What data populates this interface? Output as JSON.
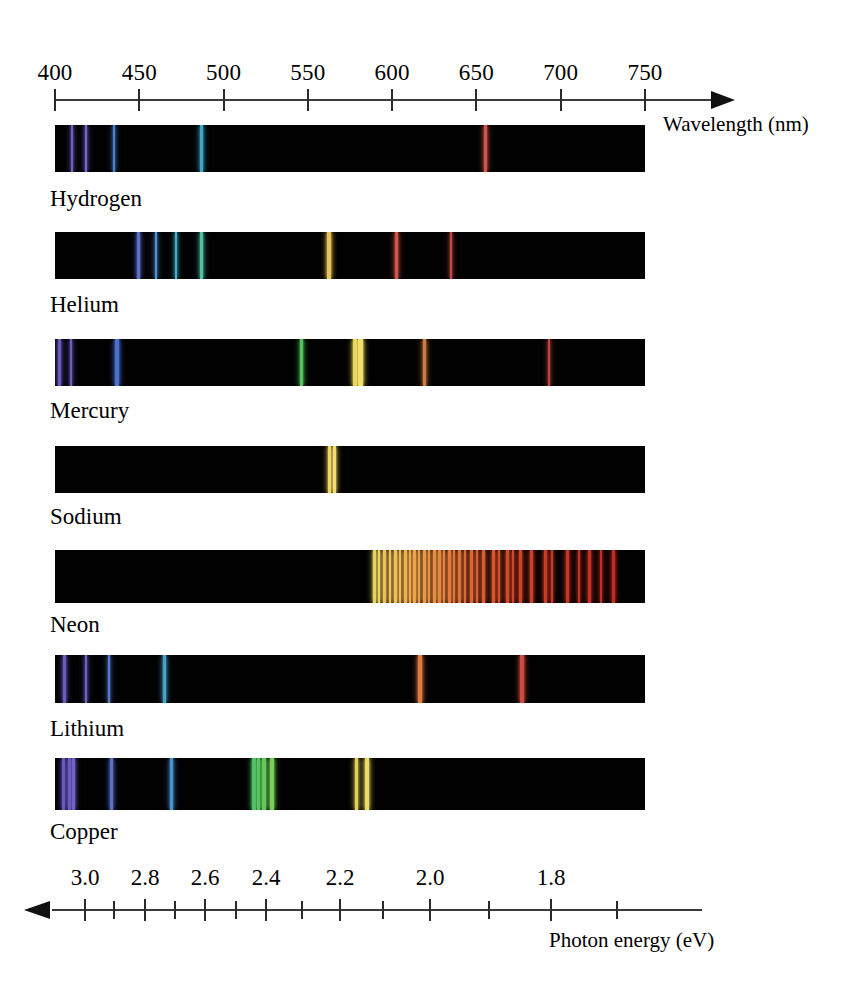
{
  "figure": {
    "kind": "emission-line-spectra",
    "background_color": "#ffffff",
    "band_color": "#010101"
  },
  "wavelength_axis": {
    "title": "Wavelength (nm)",
    "unit": "nm",
    "direction": "left-to-right",
    "arrow": "right",
    "range_nm": [
      390,
      760
    ],
    "pixel_range": [
      55,
      645
    ],
    "ticks": [
      400,
      450,
      500,
      550,
      600,
      650,
      700,
      750
    ],
    "tick_labels": [
      "400",
      "450",
      "500",
      "550",
      "600",
      "650",
      "700",
      "750"
    ]
  },
  "energy_axis": {
    "title": "Photon energy (eV)",
    "unit": "eV",
    "direction": "right-to-left",
    "arrow": "left",
    "major_ticks": [
      3.0,
      2.8,
      2.6,
      2.4,
      2.2,
      2.0,
      1.8
    ],
    "major_tick_labels": [
      "3.0",
      "2.8",
      "2.6",
      "2.4",
      "2.2",
      "2.0",
      "1.8"
    ],
    "minor_ticks": [
      2.9,
      2.7,
      2.5,
      2.3,
      2.1,
      1.9,
      1.7
    ],
    "major_pixels": [
      85,
      145,
      205,
      266,
      340,
      430,
      551
    ],
    "minor_pixels": [
      114,
      175,
      236,
      302,
      383,
      489,
      617
    ],
    "line_pixel_range": [
      52,
      702
    ]
  },
  "chart_data": {
    "type": "line-spectrum",
    "title": "",
    "xlabel": "Wavelength (nm)",
    "secondary_xlabel": "Photon energy (eV)",
    "xlim": [
      390,
      760
    ],
    "grid": false,
    "legend": "none",
    "series": [
      {
        "name": "Hydrogen",
        "lines_nm": [
          410,
          434,
          486,
          656
        ],
        "line_pixels": [
          71,
          85,
          113,
          200,
          484
        ],
        "line_widths": [
          2,
          2,
          2,
          3,
          3
        ],
        "line_colors": [
          "#6d5fbd",
          "#7766c8",
          "#4a7fd0",
          "#3fa7c7",
          "#d0554b"
        ]
      },
      {
        "name": "Helium",
        "lines_nm": [
          447,
          471,
          492,
          502,
          588,
          668,
          706
        ],
        "line_pixels": [
          137,
          155,
          175,
          200,
          327,
          395,
          450
        ],
        "line_widths": [
          3,
          2,
          2,
          3,
          4,
          3,
          2
        ],
        "line_colors": [
          "#5e6fcc",
          "#4f8fd2",
          "#3fb0c6",
          "#52bfa0",
          "#e8c25c",
          "#d0554b",
          "#c14a42"
        ]
      },
      {
        "name": "Mercury",
        "lines_nm": [
          405,
          408,
          436,
          546,
          577,
          579,
          615,
          691
        ],
        "line_pixels": [
          58,
          70,
          115,
          300,
          353,
          358,
          423,
          548
        ],
        "line_widths": [
          3,
          2,
          4,
          3,
          4,
          5,
          3,
          2
        ],
        "line_colors": [
          "#6b58c0",
          "#6d5fbd",
          "#4b6fd0",
          "#55c35f",
          "#e6d558",
          "#f2e06a",
          "#cf7a45",
          "#bb463f"
        ]
      },
      {
        "name": "Sodium",
        "lines_nm": [
          589.0,
          589.6
        ],
        "line_pixels": [
          328,
          333
        ],
        "line_widths": [
          3,
          3
        ],
        "line_colors": [
          "#f0d563",
          "#f3dc70"
        ]
      },
      {
        "name": "Neon",
        "lines_nm": [
          585,
          588,
          594,
          597,
          603,
          607,
          609,
          614,
          616,
          621,
          626,
          630,
          633,
          638,
          640,
          650,
          653,
          660,
          667,
          671,
          692,
          703,
          717,
          724,
          743
        ],
        "line_pixels": [
          373,
          378,
          383,
          389,
          394,
          399,
          404,
          409,
          413,
          418,
          423,
          428,
          433,
          438,
          443,
          448,
          453,
          458,
          464,
          470,
          476,
          482,
          492,
          498,
          506,
          512,
          519,
          530,
          544,
          551,
          566,
          578,
          588,
          600,
          612
        ],
        "line_widths": [
          3,
          2,
          3,
          2,
          3,
          2,
          3,
          2,
          3,
          2,
          3,
          2,
          3,
          3,
          2,
          3,
          2,
          3,
          2,
          3,
          2,
          3,
          3,
          2,
          3,
          2,
          3,
          3,
          3,
          2,
          3,
          2,
          3,
          2,
          3
        ],
        "line_colors": [
          "#e8d25e",
          "#ecd864",
          "#eebf58",
          "#efc35c",
          "#f0c05a",
          "#edb955",
          "#eeb452",
          "#eda94e",
          "#eba54c",
          "#eb9e49",
          "#e99a47",
          "#e89445",
          "#e78e43",
          "#e68841",
          "#e5833f",
          "#e37c3d",
          "#e2763b",
          "#e17139",
          "#df6b37",
          "#de6535",
          "#dc6033",
          "#da5a31",
          "#d8552f",
          "#d6502d",
          "#d44b2c",
          "#d2472b",
          "#d0432a",
          "#ce3f29",
          "#cc3b28",
          "#ca3827",
          "#c83526",
          "#c63225",
          "#c43024",
          "#c22e23",
          "#c02c22"
        ]
      },
      {
        "name": "Lithium",
        "lines_nm": [
          413,
          427,
          441,
          460,
          610,
          671
        ],
        "line_pixels": [
          63,
          85,
          108,
          163,
          418,
          520
        ],
        "line_widths": [
          3,
          2,
          2,
          3,
          4,
          4
        ],
        "line_colors": [
          "#6a5bbf",
          "#6b64c4",
          "#5a7ccd",
          "#49a0cb",
          "#e07a42",
          "#cf4a40"
        ]
      },
      {
        "name": "Copper",
        "lines_nm": [
          402,
          406,
          410,
          427,
          448,
          510,
          515,
          522,
          529,
          570,
          578
        ],
        "line_pixels": [
          62,
          68,
          72,
          110,
          170,
          252,
          257,
          262,
          270,
          355,
          365
        ],
        "line_widths": [
          3,
          3,
          3,
          3,
          3,
          4,
          3,
          4,
          4,
          3,
          4
        ],
        "line_colors": [
          "#6a57c2",
          "#6c5bc0",
          "#6f62c6",
          "#5a6fcb",
          "#4a92cd",
          "#4fc06a",
          "#57c55f",
          "#62c95c",
          "#7acd58",
          "#e3cf5b",
          "#eedb66"
        ]
      }
    ]
  },
  "spectra_layout": {
    "band_left": 55,
    "band_right": 645,
    "row_tops": [
      125,
      232,
      339,
      446,
      550,
      655,
      758
    ],
    "band_heights": [
      47,
      47,
      47,
      47,
      53,
      48,
      52
    ],
    "label_tops": [
      186,
      292,
      398,
      504,
      612,
      716,
      819
    ],
    "label_left": 50
  }
}
